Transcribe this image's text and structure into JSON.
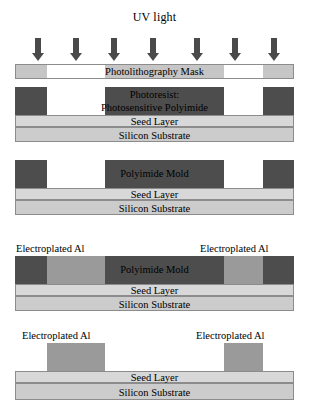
{
  "figure": {
    "title": "UV light",
    "type": "process-flow-cross-section",
    "arrow_count": 7,
    "colors": {
      "photoresist": "#4d4d4d",
      "polyimide_mold": "#4d4d4d",
      "electroplated_al": "#9a9a9a",
      "seed_layer": "#d8d8d8",
      "silicon_substrate": "#cccccc",
      "mask_chrome": "#c6c6c6",
      "arrow": "#4a4a4a",
      "outline": "#8c8c8c"
    }
  },
  "stage1": {
    "mask_label": "Photolithography Mask"
  },
  "stage2": {
    "resist_label_line1": "Photoresist:",
    "resist_label_line2": "Photosensitive Polyimide",
    "seed_label": "Seed Layer",
    "substrate_label": "Silicon Substrate"
  },
  "stage3": {
    "mold_label": "Polyimide Mold",
    "seed_label": "Seed Layer",
    "substrate_label": "Silicon Substrate"
  },
  "stage4": {
    "al_label_left": "Electroplated Al",
    "al_label_right": "Electroplated Al",
    "mold_label": "Polyimide Mold",
    "seed_label": "Seed Layer",
    "substrate_label": "Silicon Substrate"
  },
  "stage5": {
    "al_label_left": "Electroplated Al",
    "al_label_right": "Electroplated Al",
    "seed_label": "Seed Layer",
    "substrate_label": "Silicon Substrate"
  }
}
